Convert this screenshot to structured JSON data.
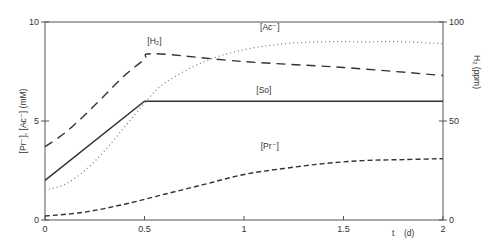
{
  "chart_data": {
    "type": "line",
    "title": "",
    "xlabel": "t (d)",
    "ylabel_left": "[Pr⁻], [Ac⁻] (mM)",
    "ylabel_right": "H₂ (ppm)",
    "xlim": [
      0,
      2
    ],
    "ylim_left": [
      0,
      10
    ],
    "ylim_right": [
      0,
      100
    ],
    "x_ticks": [
      "0",
      "0.5",
      "1",
      "1.5",
      "2"
    ],
    "y_ticks_left": [
      "0",
      "5",
      "10"
    ],
    "y_ticks_right": [
      "0",
      "50",
      "100"
    ],
    "grid": false,
    "series": [
      {
        "name": "[H₂]",
        "style": "long-dash",
        "axis": "right",
        "x": [
          0,
          0.1,
          0.2,
          0.3,
          0.4,
          0.5,
          0.55,
          1.0,
          1.5,
          2.0
        ],
        "values": [
          37,
          44,
          53,
          63,
          73,
          81,
          84,
          80,
          77,
          73
        ]
      },
      {
        "name": "[So]",
        "style": "solid",
        "axis": "left",
        "x": [
          0,
          0.5,
          2.0
        ],
        "values": [
          2.0,
          6.0,
          6.0
        ]
      },
      {
        "name": "[Ac⁻]",
        "style": "dotted",
        "axis": "left",
        "x": [
          0,
          0.1,
          0.2,
          0.3,
          0.4,
          0.5,
          0.6,
          0.8,
          1.0,
          1.2,
          1.4,
          1.6,
          1.8,
          2.0
        ],
        "values": [
          1.5,
          1.8,
          2.5,
          3.5,
          4.7,
          5.9,
          6.9,
          8.0,
          8.6,
          8.9,
          9.0,
          9.0,
          9.0,
          8.9
        ]
      },
      {
        "name": "[Pr⁻]",
        "style": "short-dash",
        "axis": "left",
        "x": [
          0,
          0.2,
          0.4,
          0.6,
          0.8,
          1.0,
          1.2,
          1.4,
          1.6,
          1.8,
          2.0
        ],
        "values": [
          0.2,
          0.4,
          0.8,
          1.3,
          1.8,
          2.3,
          2.6,
          2.85,
          3.0,
          3.05,
          3.1
        ]
      }
    ],
    "annotations": [
      {
        "text": "[H₂]",
        "x": 0.55,
        "y": 8.9
      },
      {
        "text": "[Ac⁻]",
        "x": 1.13,
        "y": 9.6
      },
      {
        "text": "[So]",
        "x": 1.1,
        "y": 6.4
      },
      {
        "text": "[Pr⁻]",
        "x": 1.13,
        "y": 3.6
      }
    ]
  },
  "labels": {
    "xlabel_t": "t",
    "xlabel_unit": "(d)",
    "left_axis": "[Pr⁻], [Ac⁻]  (mM)",
    "right_axis": "H₂  (ppm)"
  }
}
